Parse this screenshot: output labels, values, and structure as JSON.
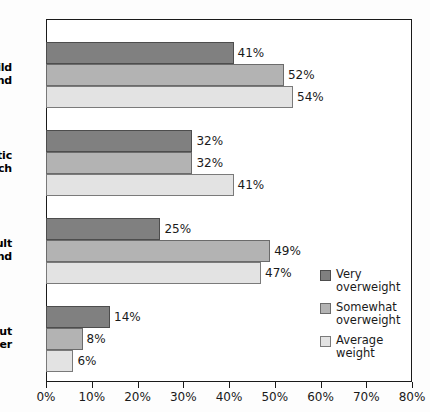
{
  "chart_data": {
    "type": "bar",
    "orientation": "horizontal",
    "title": "",
    "xlabel": "",
    "ylabel": "",
    "xlim": [
      0,
      80
    ],
    "xtick_labels": [
      "0%",
      "10%",
      "20%",
      "30%",
      "40%",
      "50%",
      "60%",
      "70%",
      "80%"
    ],
    "xtick_values": [
      0,
      10,
      20,
      30,
      40,
      50,
      60,
      70,
      80
    ],
    "grid": false,
    "legend_position": "inside-right",
    "categories": [
      "Child friend",
      "Athletic coach",
      "Adult friend",
      "Scout leader"
    ],
    "category_label_lines": [
      [
        "Child",
        "friend"
      ],
      [
        "Athletic",
        "coach"
      ],
      [
        "Adult",
        "friend"
      ],
      [
        "Scout",
        "leader"
      ]
    ],
    "series": [
      {
        "name": "Very overweight",
        "legend_lines": [
          "Very",
          "overweight"
        ],
        "color": "#808080",
        "values": [
          41,
          32,
          25,
          14
        ],
        "value_labels": [
          "41%",
          "32%",
          "25%",
          "14%"
        ]
      },
      {
        "name": "Somewhat overweight",
        "legend_lines": [
          "Somewhat",
          "overweight"
        ],
        "color": "#b3b3b3",
        "values": [
          52,
          32,
          49,
          8
        ],
        "value_labels": [
          "52%",
          "32%",
          "49%",
          "8%"
        ]
      },
      {
        "name": "Average weight",
        "legend_lines": [
          "Average",
          "weight"
        ],
        "color": "#e3e3e3",
        "values": [
          54,
          41,
          47,
          6
        ],
        "value_labels": [
          "54%",
          "41%",
          "47%",
          "6%"
        ]
      }
    ]
  }
}
